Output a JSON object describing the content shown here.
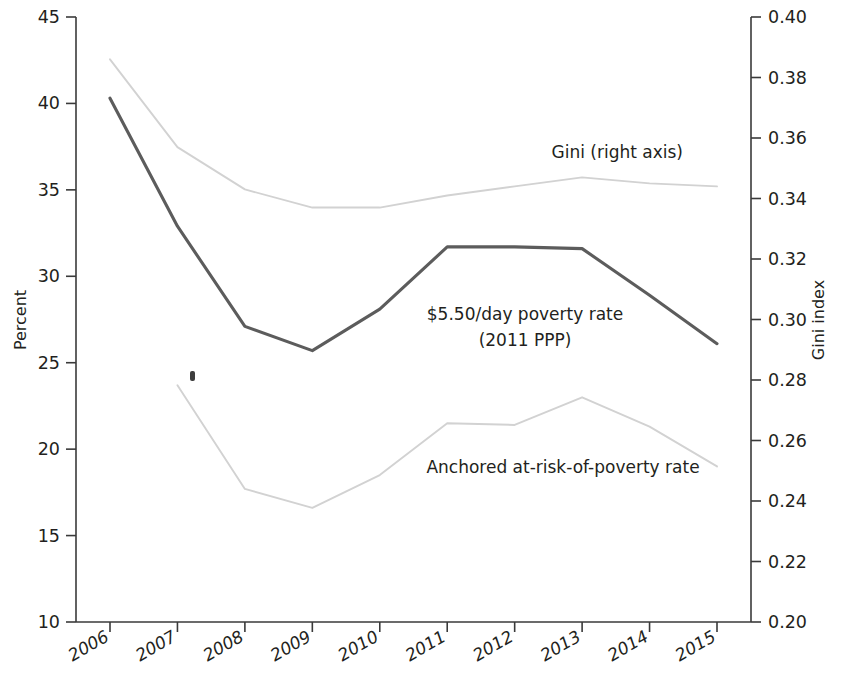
{
  "chart_data": {
    "type": "line",
    "title": "",
    "subtitle": "",
    "xlabel": "",
    "ylabel": "Percent",
    "y2label": "Gini index",
    "categories": [
      "2006",
      "2007",
      "2008",
      "2009",
      "2010",
      "2011",
      "2012",
      "2013",
      "2014",
      "2015"
    ],
    "x": [
      2006,
      2007,
      2008,
      2009,
      2010,
      2011,
      2012,
      2013,
      2014,
      2015
    ],
    "ylim": [
      10,
      45
    ],
    "y2lim": [
      0.2,
      0.4
    ],
    "yticks": [
      "10",
      "15",
      "20",
      "25",
      "30",
      "35",
      "40",
      "45"
    ],
    "ytick_values": [
      10,
      15,
      20,
      25,
      30,
      35,
      40,
      45
    ],
    "y2ticks": [
      "0.20",
      "0.22",
      "0.24",
      "0.26",
      "0.28",
      "0.30",
      "0.32",
      "0.34",
      "0.36",
      "0.38",
      "0.40"
    ],
    "y2tick_values": [
      0.2,
      0.22,
      0.24,
      0.26,
      0.28,
      0.3,
      0.32,
      0.34,
      0.36,
      0.38,
      0.4
    ],
    "grid": false,
    "legend": "inline annotations",
    "series": [
      {
        "name": "$5.50/day poverty rate (2011 PPP)",
        "axis": "left",
        "color": "#5c5c5c",
        "x": [
          2006,
          2007,
          2008,
          2009,
          2010,
          2011,
          2012,
          2013,
          2014,
          2015
        ],
        "values": [
          40.3,
          32.9,
          27.1,
          25.7,
          28.1,
          31.7,
          31.7,
          31.6,
          28.9,
          26.1
        ]
      },
      {
        "name": "Anchored at-risk-of-poverty rate",
        "axis": "left",
        "color": "#d2d2d2",
        "x": [
          2007,
          2008,
          2009,
          2010,
          2011,
          2012,
          2013,
          2014,
          2015
        ],
        "values": [
          23.7,
          17.7,
          16.6,
          18.5,
          21.5,
          21.4,
          23.0,
          21.3,
          19.0
        ]
      },
      {
        "name": "Gini (right axis)",
        "axis": "right",
        "color": "#d2d2d2",
        "x": [
          2006,
          2007,
          2008,
          2009,
          2010,
          2011,
          2012,
          2013,
          2014,
          2015
        ],
        "values": [
          0.386,
          0.357,
          0.343,
          0.337,
          0.337,
          0.341,
          0.344,
          0.347,
          0.345,
          0.344
        ]
      }
    ],
    "annotations": [
      {
        "name": "gini-label",
        "text": "Gini (right axis)",
        "x": 2012.0,
        "y_percent": 36.4
      },
      {
        "name": "poverty-label-line1",
        "text": "$5.50/day poverty rate",
        "x": 2010.8,
        "y_percent": 28.4
      },
      {
        "name": "poverty-label-line2",
        "text": "(2011 PPP)",
        "x": 2010.8,
        "y_percent": 27.0
      },
      {
        "name": "anchored-label",
        "text": "Anchored at-risk-of-poverty rate",
        "x": 2011.2,
        "y_percent": 19.6
      }
    ]
  },
  "axes": {
    "left": {
      "title": "Percent",
      "ticks": [
        "45",
        "40",
        "35",
        "30",
        "25",
        "20",
        "15",
        "10"
      ]
    },
    "right": {
      "title": "Gini index",
      "ticks": [
        "0.40",
        "0.38",
        "0.36",
        "0.34",
        "0.32",
        "0.30",
        "0.28",
        "0.26",
        "0.24",
        "0.22",
        "0.20"
      ]
    },
    "bottom": {
      "ticks": [
        "2006",
        "2007",
        "2008",
        "2009",
        "2010",
        "2011",
        "2012",
        "2013",
        "2014",
        "2015"
      ]
    }
  },
  "annotations": {
    "gini": "Gini (right axis)",
    "poverty_line1": "$5.50/day poverty rate",
    "poverty_line2": "(2011 PPP)",
    "anchored": "Anchored at-risk-of-poverty rate"
  }
}
